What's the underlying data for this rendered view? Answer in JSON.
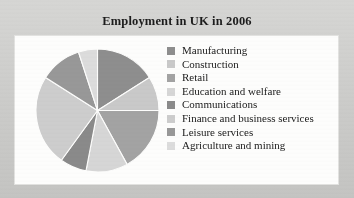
{
  "chart_data": {
    "type": "pie",
    "title": "Employment in UK in 2006",
    "xlabel": "",
    "ylabel": "",
    "legend_position": "right",
    "grid": false,
    "categories": [
      "Manufacturing",
      "Construction",
      "Retail",
      "Education and welfare",
      "Communications",
      "Finance and business services",
      "Leisure services",
      "Agriculture and mining"
    ],
    "values": [
      16,
      9,
      17,
      11,
      7,
      24,
      11,
      5
    ],
    "colors": [
      "#8e8e8e",
      "#c9c9c9",
      "#a3a3a3",
      "#d6d6d6",
      "#8a8a8a",
      "#cdcdcd",
      "#989898",
      "#dcdcdc"
    ]
  },
  "figure": {
    "background_color": "#cccccc",
    "panel_color": "#fdfdfc"
  },
  "legend": {
    "items": [
      {
        "label": "Manufacturing",
        "color": "#8e8e8e"
      },
      {
        "label": "Construction",
        "color": "#c9c9c9"
      },
      {
        "label": "Retail",
        "color": "#a3a3a3"
      },
      {
        "label": "Education and welfare",
        "color": "#d6d6d6"
      },
      {
        "label": "Communications",
        "color": "#8a8a8a"
      },
      {
        "label": "Finance and business services",
        "color": "#cdcdcd"
      },
      {
        "label": "Leisure services",
        "color": "#989898"
      },
      {
        "label": "Agriculture and mining",
        "color": "#dcdcdc"
      }
    ]
  }
}
